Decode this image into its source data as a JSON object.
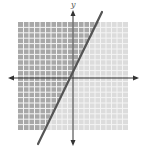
{
  "chart_data": {
    "type": "line",
    "title": "",
    "xlabel": "",
    "ylabel": "y",
    "xlim": [
      -10,
      10
    ],
    "ylim": [
      -10,
      10
    ],
    "grid": true,
    "grid_step": 1,
    "series": [
      {
        "name": "boundary line",
        "style": "solid",
        "slope": 2,
        "intercept": 0,
        "x": [
          -6,
          0,
          5.5
        ],
        "y": [
          -12,
          0,
          11
        ]
      }
    ],
    "shaded_region": "above-left of line (y > 2x)",
    "colors": {
      "shaded": "#a8a8a8",
      "unshaded": "#dcdcdc",
      "gridline": "#f2f2f2",
      "axis": "#333333",
      "line": "#555555"
    }
  },
  "labels": {
    "y_axis": "y"
  }
}
